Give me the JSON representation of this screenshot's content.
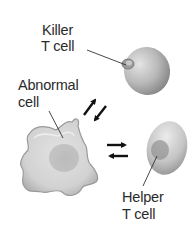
{
  "diagram": {
    "type": "biology-illustration",
    "labels": {
      "killer_t_cell": {
        "line1": "Killer",
        "line2": "T cell"
      },
      "abnormal_cell": {
        "line1": "Abnormal",
        "line2": "cell"
      },
      "helper_t_cell": {
        "line1": "Helper",
        "line2": "T cell"
      }
    },
    "nodes": [
      {
        "id": "killer-t-cell",
        "label": "Killer T cell",
        "shape": "round cell with nucleus"
      },
      {
        "id": "abnormal-cell",
        "label": "Abnormal cell",
        "shape": "irregular cell with nucleus"
      },
      {
        "id": "helper-t-cell",
        "label": "Helper T cell",
        "shape": "oval cell with nucleus"
      }
    ],
    "edges": [
      {
        "from": "abnormal-cell",
        "to": "killer-t-cell",
        "style": "bidirectional arrow pair"
      },
      {
        "from": "abnormal-cell",
        "to": "helper-t-cell",
        "style": "bidirectional arrow pair"
      }
    ],
    "colors": {
      "text": "#2b2b2b",
      "cell_light": "#e6e6e6",
      "cell_mid": "#bdbdbd",
      "cell_dark": "#8a8a8a",
      "nucleus": "#9a9a9a",
      "arrow": "#111111",
      "leader_line": "#333333"
    }
  }
}
